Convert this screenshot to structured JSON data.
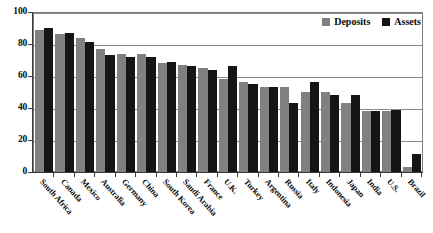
{
  "chart_data": {
    "type": "bar",
    "title": "",
    "subtitle": "",
    "xlabel": "",
    "ylabel": "",
    "ylim": [
      0,
      100
    ],
    "yticks": [
      0,
      20,
      40,
      60,
      80,
      100
    ],
    "grid": true,
    "grid_axis": "y",
    "legend_position": "top-right",
    "categories": [
      "South Africa",
      "Canada",
      "Mexico",
      "Australia",
      "Germany",
      "China",
      "South Korea",
      "Saudi Arabia",
      "France",
      "U.K.",
      "Turkey",
      "Argentina",
      "Russia",
      "Italy",
      "Indonesia",
      "Japan",
      "India",
      "U.S.",
      "Brazil"
    ],
    "series": [
      {
        "name": "Deposits",
        "color": "#808080",
        "values": [
          89,
          86,
          84,
          77,
          74,
          74,
          68,
          67,
          65,
          58,
          56,
          53,
          53,
          50,
          50,
          43,
          38,
          38,
          3
        ]
      },
      {
        "name": "Assets",
        "color": "#151515",
        "values": [
          90,
          87,
          81,
          73,
          72,
          72,
          69,
          66,
          64,
          66,
          55,
          53,
          43,
          56,
          48,
          48,
          38,
          39,
          11
        ]
      }
    ]
  },
  "legend": {
    "items": [
      {
        "label": "Deposits",
        "color": "#808080"
      },
      {
        "label": "Assets",
        "color": "#151515"
      }
    ]
  },
  "colors": {
    "deposits": "#808080",
    "assets": "#151515",
    "axis": "#3a3a3a",
    "grid": "#8a8a8a",
    "background": "#ffffff"
  }
}
